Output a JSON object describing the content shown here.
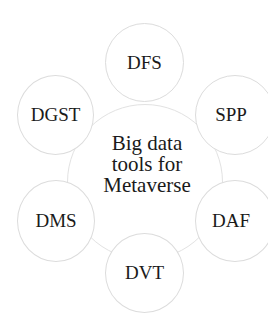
{
  "diagram": {
    "center": {
      "lines": [
        "Big data",
        "tools for",
        "Metaverse"
      ]
    },
    "nodes": [
      {
        "label": "DFS"
      },
      {
        "label": "SPP"
      },
      {
        "label": "DAF"
      },
      {
        "label": "DVT"
      },
      {
        "label": "DMS"
      },
      {
        "label": "DGST"
      }
    ],
    "colors": {
      "circle_stroke": "#dcdcdc",
      "text": "#1a1a1a",
      "background": "#ffffff"
    }
  }
}
